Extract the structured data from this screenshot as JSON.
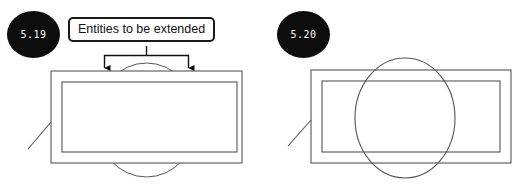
{
  "page": {
    "background_color": "#ffffff",
    "line_color": "#555555",
    "annotation_color": "#1a1a1a",
    "badge_color": "#0d0d0d",
    "badge_text_color": "#ffffff"
  },
  "figures": [
    {
      "id": "figure-5-19",
      "number": "5.19",
      "caption_label": "Entities to be extended",
      "description": "Nested rectangles with a trimmed circle; only the top and bottom arcs of the circle protrude beyond the rectangles",
      "circle_state": "trimmed"
    },
    {
      "id": "figure-5-20",
      "number": "5.20",
      "caption_label": "",
      "description": "Nested rectangles with the full circle extended and visible, overlapping both rectangles",
      "circle_state": "extended"
    }
  ],
  "annotations": {
    "callout_text": "Entities to be extended",
    "arrow_count": 2
  }
}
